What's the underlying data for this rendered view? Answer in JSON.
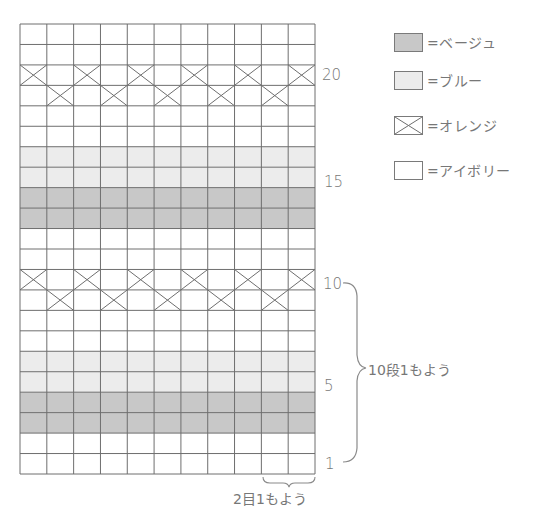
{
  "chart_data": {
    "type": "heatmap",
    "title": "",
    "grid": {
      "columns": 11,
      "rows": 22,
      "gridlines": true
    },
    "colors": {
      "beige": "#c8c8c8",
      "blue": "#ececec",
      "orange": "cross",
      "ivory": "#ffffff",
      "line": "#6e6e6e"
    },
    "rows_bottom_to_top": [
      {
        "row": 1,
        "fill": "ivory"
      },
      {
        "row": 2,
        "fill": "ivory"
      },
      {
        "row": 3,
        "fill": "beige"
      },
      {
        "row": 4,
        "fill": "beige"
      },
      {
        "row": 5,
        "fill": "blue"
      },
      {
        "row": 6,
        "fill": "blue"
      },
      {
        "row": 7,
        "fill": "ivory"
      },
      {
        "row": 8,
        "fill": "ivory"
      },
      {
        "row": 9,
        "fill": "ivory",
        "orange_columns": [
          2,
          4,
          6,
          8,
          10
        ]
      },
      {
        "row": 10,
        "fill": "ivory",
        "orange_columns": [
          1,
          3,
          5,
          7,
          9,
          11
        ]
      },
      {
        "row": 11,
        "fill": "ivory"
      },
      {
        "row": 12,
        "fill": "ivory"
      },
      {
        "row": 13,
        "fill": "beige"
      },
      {
        "row": 14,
        "fill": "beige"
      },
      {
        "row": 15,
        "fill": "blue"
      },
      {
        "row": 16,
        "fill": "blue"
      },
      {
        "row": 17,
        "fill": "ivory"
      },
      {
        "row": 18,
        "fill": "ivory"
      },
      {
        "row": 19,
        "fill": "ivory",
        "orange_columns": [
          2,
          4,
          6,
          8,
          10
        ]
      },
      {
        "row": 20,
        "fill": "ivory",
        "orange_columns": [
          1,
          3,
          5,
          7,
          9,
          11
        ]
      },
      {
        "row": 21,
        "fill": "ivory"
      },
      {
        "row": 22,
        "fill": "ivory"
      }
    ],
    "row_tick_labels": [
      {
        "row": 20,
        "label": "20"
      },
      {
        "row": 15,
        "label": "15"
      },
      {
        "row": 10,
        "label": "10"
      },
      {
        "row": 5,
        "label": "5"
      },
      {
        "row": 1,
        "label": "1"
      }
    ],
    "annotations": [
      {
        "type": "brace-vertical",
        "from_row": 1,
        "to_row": 10,
        "text": "10段1もよう"
      },
      {
        "type": "brace-horizontal",
        "from_col": 10,
        "to_col": 11,
        "text": "2目1もよう"
      }
    ],
    "legend": [
      {
        "key": "beige",
        "label": "=ベージュ"
      },
      {
        "key": "blue",
        "label": "=ブルー"
      },
      {
        "key": "orange",
        "label": "=オレンジ"
      },
      {
        "key": "ivory",
        "label": "=アイボリー"
      }
    ],
    "legend_position": "top-right"
  },
  "labels": {
    "row_repeat": "10段1もよう",
    "stitch_repeat": "2目1もよう",
    "ticks": {
      "r20": "20",
      "r15": "15",
      "r10": "10",
      "r5": "5",
      "r1": "1"
    }
  },
  "legend": [
    {
      "label": "=ベージュ"
    },
    {
      "label": "=ブルー"
    },
    {
      "label": "=オレンジ"
    },
    {
      "label": "=アイボリー"
    }
  ]
}
